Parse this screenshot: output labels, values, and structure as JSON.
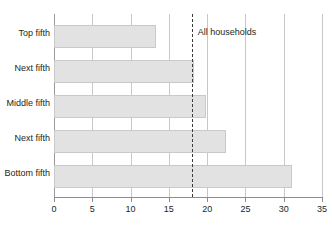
{
  "chart_data": {
    "type": "bar",
    "orientation": "horizontal",
    "title": "",
    "xlabel": "",
    "ylabel": "",
    "categories": [
      "Top fifth",
      "Next fifth",
      "Middle fifth",
      "Next fifth",
      "Bottom fifth"
    ],
    "values": [
      13.3,
      18.3,
      19.8,
      22.4,
      31.1
    ],
    "xlim": [
      0,
      35
    ],
    "xticks": [
      0,
      5,
      10,
      15,
      20,
      25,
      30,
      35
    ],
    "xtick_labels": [
      "0",
      "5",
      "10",
      "15",
      "20",
      "25",
      "30",
      "35"
    ],
    "grid": "vertical",
    "legend": "none",
    "annotations": [
      {
        "name": "all-households-reference",
        "label": "All households",
        "value": 18.0,
        "style": "dashed-vertical-line"
      }
    ],
    "colors": {
      "bar_fill": "#e2e2e2",
      "bar_border": "#c9c9c9",
      "gridline": "#c8c8c8",
      "axis": "#8c8c8c",
      "text": "#231f20",
      "reference_line": "#3a3a3a"
    }
  }
}
